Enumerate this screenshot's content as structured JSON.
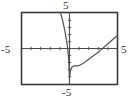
{
  "figure": {
    "kind": "graphing-calculator-window",
    "frame_color": "#3a3a3a",
    "axis_color": "#4a4a4a",
    "curve_color": "#555555",
    "background": "#ffffff",
    "labels": {
      "y_max": "5",
      "y_min": "-5",
      "x_min": "-5",
      "x_max": "5"
    }
  },
  "chart_data": {
    "type": "line",
    "title": "",
    "xlabel": "",
    "ylabel": "",
    "xlim": [
      -5,
      5
    ],
    "ylim": [
      -5,
      5
    ],
    "xticks": [
      -5,
      -4,
      -3,
      -2,
      -1,
      0,
      1,
      2,
      3,
      4,
      5
    ],
    "yticks": [
      -5,
      -4,
      -3,
      -2,
      -1,
      0,
      1,
      2,
      3,
      4,
      5
    ],
    "tick_labels_shown": [
      "-5",
      "5",
      "-5",
      "5"
    ],
    "grid": false,
    "legend": false,
    "series": [
      {
        "name": "left-branch",
        "comment": "descends steeply from upper area toward vertical asymptote at x = 0",
        "x": [
          -0.95,
          -0.85,
          -0.75,
          -0.65,
          -0.55,
          -0.45,
          -0.38,
          -0.3,
          -0.24,
          -0.18,
          -0.13,
          -0.09,
          -0.06,
          -0.035,
          -0.02
        ],
        "y": [
          5.0,
          4.55,
          4.05,
          3.5,
          2.9,
          2.2,
          1.65,
          1.05,
          0.5,
          -0.1,
          -0.75,
          -1.45,
          -2.15,
          -2.95,
          -3.7
        ]
      },
      {
        "name": "right-branch",
        "comment": "rises from lower asymptote, minimum near x = 0.75, crosses x-axis near x = 3.4",
        "x": [
          0.02,
          0.05,
          0.09,
          0.14,
          0.2,
          0.28,
          0.38,
          0.5,
          0.62,
          0.75,
          0.9,
          1.1,
          1.35,
          1.6,
          1.9,
          2.2,
          2.5,
          2.8,
          3.1,
          3.4,
          3.7,
          4.0,
          4.3,
          4.6,
          4.9
        ],
        "y": [
          -3.85,
          -3.5,
          -3.15,
          -2.9,
          -2.7,
          -2.55,
          -2.45,
          -2.4,
          -2.4,
          -2.42,
          -2.4,
          -2.3,
          -2.12,
          -1.9,
          -1.6,
          -1.3,
          -1.0,
          -0.7,
          -0.4,
          -0.05,
          0.3,
          0.65,
          1.0,
          1.35,
          1.7
        ]
      }
    ],
    "asymptote": {
      "type": "vertical",
      "x": 0
    },
    "x_intercept_approx": 3.4,
    "minimum_approx": {
      "x": 0.7,
      "y": -2.42
    }
  }
}
